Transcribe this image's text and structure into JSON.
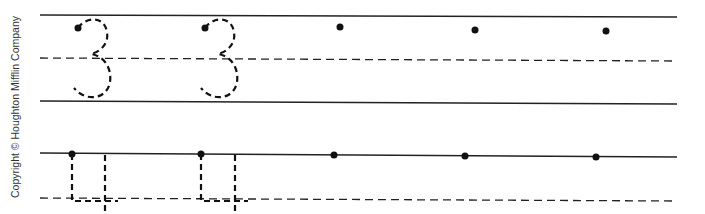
{
  "worksheet": {
    "copyright": "Copyright © Houghton Mifflin Company",
    "rows": [
      {
        "name": "digit-3-row",
        "traced_character": "3",
        "traced_count": 2,
        "practice_start_dots": 3
      },
      {
        "name": "digit-4-row",
        "traced_character": "4",
        "traced_count": 2,
        "practice_start_dots": 3
      }
    ],
    "ink_color": "#111111",
    "line_color": "#222222"
  }
}
